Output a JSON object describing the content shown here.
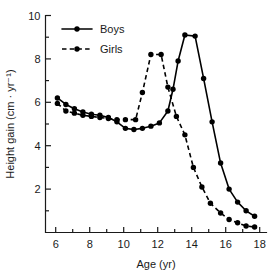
{
  "chart_data": {
    "type": "line",
    "title": "",
    "xlabel": "Age (yr)",
    "ylabel": "Height gain (cm · yr⁻¹)",
    "xlim": [
      5.4,
      18.4
    ],
    "ylim": [
      0,
      10
    ],
    "grid": false,
    "legend_position": "top-left",
    "x_ticks_major": [
      6,
      8,
      10,
      12,
      14,
      16,
      18
    ],
    "x_tick_labels": [
      "6",
      "8",
      "10",
      "12",
      "14",
      "16",
      "18"
    ],
    "x_ticks_minor": [
      7,
      9,
      11,
      13,
      15,
      17
    ],
    "y_ticks_major": [
      2,
      4,
      6,
      8,
      10
    ],
    "y_tick_labels": [
      "2",
      "4",
      "6",
      "8",
      "10"
    ],
    "y_ticks_minor": [
      1,
      3,
      5,
      7,
      9
    ],
    "series": [
      {
        "name": "Boys",
        "style": "solid",
        "marker": "filled-circle",
        "color": "#000000",
        "x": [
          6.1,
          6.6,
          7.1,
          7.6,
          8.1,
          8.6,
          9.1,
          9.6,
          10.1,
          10.6,
          11.1,
          11.6,
          12.1,
          12.6,
          12.9,
          13.2,
          13.6,
          14.2,
          14.7,
          15.2,
          15.7,
          16.2,
          16.7,
          17.2,
          17.7
        ],
        "y": [
          6.2,
          5.9,
          5.7,
          5.55,
          5.45,
          5.4,
          5.3,
          5.1,
          4.8,
          4.75,
          4.8,
          4.9,
          5.05,
          5.6,
          6.6,
          7.9,
          9.1,
          9.05,
          7.1,
          5.1,
          3.2,
          2.0,
          1.4,
          1.0,
          0.75
        ]
      },
      {
        "name": "Girls",
        "style": "dashed",
        "marker": "filled-circle",
        "color": "#000000",
        "x": [
          6.1,
          6.6,
          7.1,
          7.6,
          8.1,
          8.6,
          9.1,
          9.6,
          10.1,
          10.7,
          11.1,
          11.6,
          12.2,
          12.6,
          13.1,
          13.6,
          14.1,
          14.6,
          15.1,
          15.7,
          16.2,
          16.7,
          17.2,
          17.7
        ],
        "y": [
          5.95,
          5.6,
          5.5,
          5.4,
          5.35,
          5.3,
          5.25,
          5.2,
          5.2,
          5.2,
          6.45,
          8.2,
          8.2,
          6.7,
          5.35,
          4.5,
          3.0,
          2.1,
          1.35,
          0.9,
          0.6,
          0.45,
          0.3,
          0.25
        ]
      }
    ]
  },
  "legend": {
    "items": [
      {
        "label": "Boys"
      },
      {
        "label": "Girls"
      }
    ]
  },
  "axes": {
    "x_title": "Age (yr)",
    "y_title": "Height gain (cm · yr⁻¹)"
  }
}
